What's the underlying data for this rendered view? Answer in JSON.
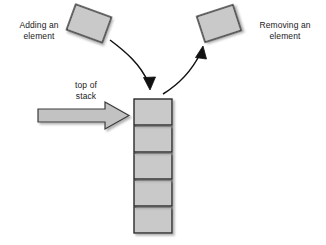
{
  "diagram": {
    "background_color": "#ffffff",
    "box_fill_color": "#c9c9c9",
    "box_stroke_color": "#2b2b2b",
    "arrow_fill_color": "#c2c2c2",
    "arrow_stroke_color": "#3a3a3a",
    "curve_color": "#111111",
    "text_color": "#1a1a1a"
  },
  "labels": {
    "adding": "Adding an\nelement",
    "removing": "Removing an\nelement",
    "top_of_stack": "top of\nstack"
  },
  "elements": {
    "incoming_box": {
      "name": "element being pushed",
      "x": 70,
      "y": 10,
      "width": 38,
      "height": 27,
      "rotation_deg": 20
    },
    "outgoing_box": {
      "name": "element being popped",
      "x": 200,
      "y": 10,
      "width": 38,
      "height": 27,
      "rotation_deg": -18
    },
    "stack": {
      "name": "stack of elements",
      "count": 5,
      "box_width": 38,
      "box_height": 26,
      "gap": 2,
      "left": 134,
      "top": 99
    },
    "push_curve": {
      "name": "push arrow",
      "from": [
        110,
        40
      ],
      "to": [
        150,
        88
      ],
      "direction": "down"
    },
    "pop_curve": {
      "name": "pop arrow",
      "from": [
        163,
        92
      ],
      "to": [
        203,
        44
      ],
      "direction": "up"
    },
    "block_arrow": {
      "name": "top of stack pointer",
      "from_x": 38,
      "to_x": 129,
      "center_y": 115,
      "shaft_height": 13,
      "head_height": 26
    }
  }
}
